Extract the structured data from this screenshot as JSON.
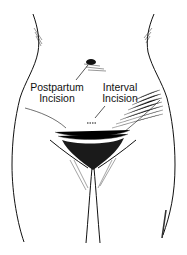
{
  "figure": {
    "labels": {
      "postpartum": {
        "line1": "Postpartum",
        "line2": "Incision"
      },
      "interval": {
        "line1": "Interval",
        "line2": "Incision"
      }
    },
    "colors": {
      "ink": "#111111",
      "background": "#ffffff"
    }
  }
}
